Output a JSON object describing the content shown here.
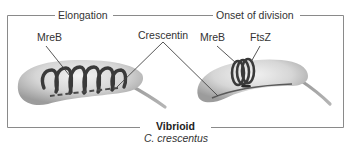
{
  "panels": [
    {
      "id": "elongation",
      "title": "Elongation"
    },
    {
      "id": "onset",
      "title": "Onset of division"
    }
  ],
  "labels": {
    "mreb_left": "MreB",
    "crescentin": "Crescentin",
    "mreb_right": "MreB",
    "ftsz": "FtsZ"
  },
  "caption": {
    "shape": "Vibrioid",
    "organism": "C. crescentus"
  },
  "colors": {
    "frame": "#8a8a8a",
    "cell_fill": "#d9d9d9",
    "cell_shadow": "#a8a8a8",
    "filament": "#3a3a3a",
    "leader": "#444444",
    "text": "#333333"
  }
}
